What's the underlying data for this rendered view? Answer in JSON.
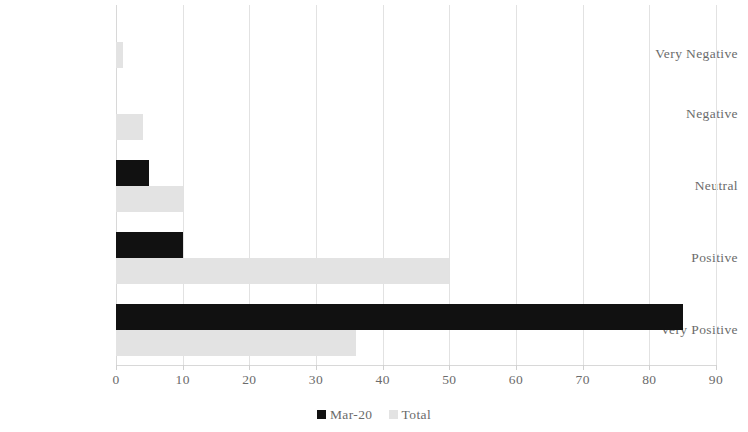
{
  "chart_data": {
    "type": "bar",
    "orientation": "horizontal",
    "title": "",
    "subtitle": "",
    "xlabel": "",
    "ylabel": "",
    "categories": [
      "Very Negative",
      "Negative",
      "Neutral",
      "Positive",
      "Very Positive"
    ],
    "series": [
      {
        "name": "Mar-20",
        "color": "#111111",
        "values": [
          0,
          0,
          5,
          10,
          85
        ]
      },
      {
        "name": "Total",
        "color": "#e3e3e3",
        "values": [
          1,
          4,
          10,
          50,
          36
        ]
      }
    ],
    "xlim": [
      0,
      90
    ],
    "xticks": [
      0,
      10,
      20,
      30,
      40,
      50,
      60,
      70,
      80,
      90
    ],
    "xtick_labels": [
      "0",
      "10",
      "20",
      "30",
      "40",
      "50",
      "60",
      "70",
      "80",
      "90"
    ],
    "grid": true,
    "grid_axis": "x",
    "legend": true,
    "legend_position": "bottom",
    "legend_entries": [
      "Mar-20",
      "Total"
    ],
    "annotations": []
  }
}
